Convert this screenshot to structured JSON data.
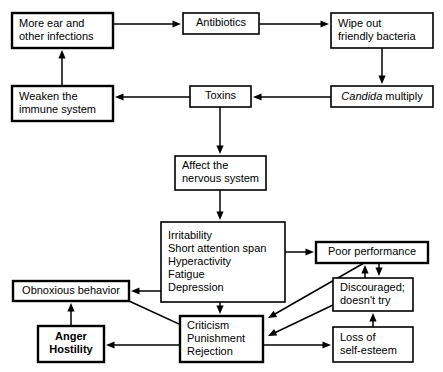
{
  "diagram": {
    "colors": {
      "background": "#ffffff",
      "line": "#000000",
      "text": "#000000"
    },
    "nodes": [
      {
        "id": "more-ear-infections",
        "lines": [
          "More ear and",
          "other infections"
        ],
        "style": "heavy",
        "x": 12,
        "y": 13,
        "w": 101,
        "h": 35,
        "align": "left"
      },
      {
        "id": "antibiotics",
        "lines": [
          "Antibiotics"
        ],
        "style": "normal",
        "x": 183,
        "y": 13,
        "w": 76,
        "h": 21,
        "align": "center"
      },
      {
        "id": "wipe-out-friendly-bacteria",
        "lines": [
          "Wipe out",
          "friendly bacteria"
        ],
        "style": "normal",
        "x": 331,
        "y": 13,
        "w": 102,
        "h": 35,
        "align": "left"
      },
      {
        "id": "candida-multiply",
        "lines": [
          "Candida multiply"
        ],
        "style": "normal",
        "x": 331,
        "y": 86,
        "w": 102,
        "h": 21,
        "align": "center",
        "italic_first_word": true
      },
      {
        "id": "toxins",
        "lines": [
          "Toxins"
        ],
        "style": "normal",
        "x": 190,
        "y": 86,
        "w": 61,
        "h": 21,
        "align": "center"
      },
      {
        "id": "weaken-immune-system",
        "lines": [
          "Weaken the",
          "immune system"
        ],
        "style": "heavy",
        "x": 12,
        "y": 86,
        "w": 101,
        "h": 35,
        "align": "left"
      },
      {
        "id": "affect-nervous-system",
        "lines": [
          "Affect the",
          "nervous system"
        ],
        "style": "normal",
        "x": 175,
        "y": 156,
        "w": 91,
        "h": 34,
        "align": "left"
      },
      {
        "id": "symptoms",
        "lines": [
          "Irritability",
          "Short attention span",
          "Hyperactivity",
          "Fatigue",
          "Depression"
        ],
        "style": "normal",
        "x": 161,
        "y": 222,
        "w": 124,
        "h": 80,
        "align": "left"
      },
      {
        "id": "poor-performance",
        "lines": [
          "Poor performance"
        ],
        "style": "heavy",
        "x": 316,
        "y": 242,
        "w": 112,
        "h": 21,
        "align": "center"
      },
      {
        "id": "discouraged",
        "lines": [
          "Discouraged;",
          "doesn't try"
        ],
        "style": "normal",
        "x": 333,
        "y": 278,
        "w": 80,
        "h": 33,
        "align": "left"
      },
      {
        "id": "obnoxious-behavior",
        "lines": [
          "Obnoxious behavior"
        ],
        "style": "heavy",
        "x": 13,
        "y": 281,
        "w": 116,
        "h": 20,
        "align": "center"
      },
      {
        "id": "anger-hostility",
        "lines": [
          "Anger",
          "Hostility"
        ],
        "style": "heavy",
        "x": 38,
        "y": 326,
        "w": 66,
        "h": 36,
        "align": "center",
        "bold": true
      },
      {
        "id": "criticism-punishment-rejection",
        "lines": [
          "Criticism",
          "Punishment",
          "Rejection"
        ],
        "style": "heavy",
        "x": 180,
        "y": 316,
        "w": 83,
        "h": 46,
        "align": "left"
      },
      {
        "id": "loss-of-self-esteem",
        "lines": [
          "Loss of",
          "self-esteem"
        ],
        "style": "normal",
        "x": 333,
        "y": 327,
        "w": 80,
        "h": 35,
        "align": "left"
      }
    ],
    "edges": [
      {
        "id": "more-ear-to-antibiotics",
        "from": "more-ear-infections",
        "to": "antibiotics",
        "points": "113,24 181,24"
      },
      {
        "id": "antibiotics-to-wipe-out",
        "from": "antibiotics",
        "to": "wipe-out-friendly-bacteria",
        "points": "259,24 329,24"
      },
      {
        "id": "wipe-out-to-candida",
        "from": "wipe-out-friendly-bacteria",
        "to": "candida-multiply",
        "points": "382,48 382,84"
      },
      {
        "id": "candida-to-toxins",
        "from": "candida-multiply",
        "to": "toxins",
        "points": "331,97 253,97"
      },
      {
        "id": "toxins-to-weaken",
        "from": "toxins",
        "to": "weaken-immune-system",
        "points": "190,97 115,97"
      },
      {
        "id": "weaken-to-more-ear",
        "from": "weaken-immune-system",
        "to": "more-ear-infections",
        "points": "62,86 62,50"
      },
      {
        "id": "toxins-to-affect",
        "from": "toxins",
        "to": "affect-nervous-system",
        "points": "220,107 220,154"
      },
      {
        "id": "affect-to-symptoms",
        "from": "affect-nervous-system",
        "to": "symptoms",
        "points": "220,190 220,220"
      },
      {
        "id": "symptoms-to-poor-performance",
        "from": "symptoms",
        "to": "poor-performance",
        "points": "285,252 314,252"
      },
      {
        "id": "symptoms-to-obnoxious",
        "from": "symptoms",
        "to": "obnoxious-behavior",
        "points": "161,291 131,291"
      },
      {
        "id": "symptoms-to-criticism",
        "from": "symptoms",
        "to": "criticism-punishment-rejection",
        "points": "220,302 220,314"
      },
      {
        "id": "poor-performance-to-criticism",
        "from": "poor-performance",
        "to": "criticism-punishment-rejection",
        "points": "364,263 268,318"
      },
      {
        "id": "discouraged-to-criticism",
        "from": "discouraged",
        "to": "criticism-punishment-rejection",
        "points": "333,305 268,336"
      },
      {
        "id": "discouraged-to-poor-performance",
        "from": "discouraged",
        "to": "poor-performance",
        "points": "365,278 365,265"
      },
      {
        "id": "poor-performance-to-discouraged",
        "from": "poor-performance",
        "to": "discouraged",
        "points": "379,263 379,276"
      },
      {
        "id": "obnoxious-to-criticism",
        "from": "obnoxious-behavior",
        "to": "criticism-punishment-rejection",
        "points": "129,301 216,341"
      },
      {
        "id": "criticism-to-anger",
        "from": "criticism-punishment-rejection",
        "to": "anger-hostility",
        "points": "180,345 106,345"
      },
      {
        "id": "anger-to-obnoxious",
        "from": "anger-hostility",
        "to": "obnoxious-behavior",
        "points": "71,326 71,303"
      },
      {
        "id": "criticism-to-loss-self-esteem",
        "from": "criticism-punishment-rejection",
        "to": "loss-of-self-esteem",
        "points": "263,345 331,345"
      },
      {
        "id": "loss-self-esteem-to-discouraged",
        "from": "loss-of-self-esteem",
        "to": "discouraged",
        "points": "373,327 373,313"
      }
    ]
  }
}
